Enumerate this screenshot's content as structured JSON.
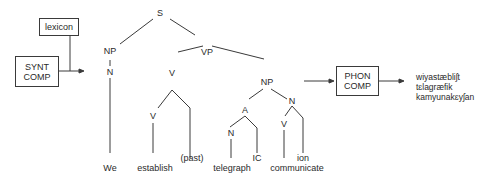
{
  "boxes": {
    "lexicon": "lexicon",
    "synt_comp": [
      "SYNT",
      "COMP"
    ],
    "phon_comp": [
      "PHON",
      "COMP"
    ]
  },
  "tree": {
    "S": "S",
    "NP_subject": "NP",
    "N_subject": "N",
    "VP": "VP",
    "V_main": "V",
    "V_inner": "V",
    "NP_object": "NP",
    "A": "A",
    "N_in_A": "N",
    "N_object": "N",
    "V_in_N": "V"
  },
  "leaves": {
    "we": "We",
    "establish": "establish",
    "past": "(past)",
    "telegraph": "telegraph",
    "ic": "IC",
    "communicate": "communicate",
    "ion": "ion"
  },
  "phonetic_output": [
    "wiyastæbliʃt",
    "tɛlagræfik",
    "kamyunakɛyʃan"
  ]
}
